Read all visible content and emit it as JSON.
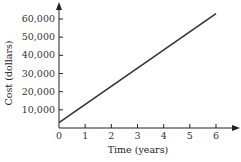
{
  "chart_data": {
    "type": "line",
    "title": "",
    "xlabel": "Time (years)",
    "ylabel": "Cost (dollars)",
    "x_ticks": [
      "0",
      "1",
      "2",
      "3",
      "4",
      "5",
      "6"
    ],
    "y_ticks": [
      "10,000",
      "20,000",
      "30,000",
      "40,000",
      "50,000",
      "60,000"
    ],
    "xlim": [
      0,
      6
    ],
    "ylim": [
      0,
      63000
    ],
    "grid": false,
    "legend": null,
    "series": [
      {
        "name": "Cost",
        "x": [
          0,
          6
        ],
        "y": [
          3000,
          63000
        ],
        "color": "#333333"
      }
    ]
  }
}
